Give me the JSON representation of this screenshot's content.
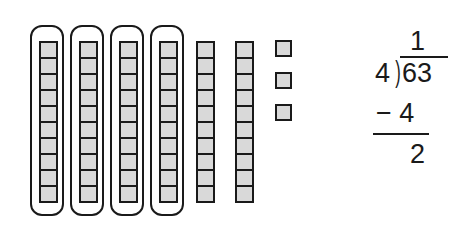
{
  "diagram": {
    "grouped_tens_rods": 4,
    "ungrouped_tens_rods": 2,
    "unit_cubes": 3,
    "cells_per_rod": 10,
    "colors": {
      "block_fill": "#d9d9d9",
      "outline": "#1a1a1a",
      "background": "#ffffff"
    }
  },
  "division": {
    "quotient_digit": "1",
    "divisor": "4",
    "dividend": "63",
    "subtraction": "− 4",
    "remainder": "2"
  }
}
